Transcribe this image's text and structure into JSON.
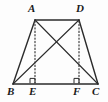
{
  "figure": {
    "width": 108,
    "height": 102,
    "background_color": "#fdfdfd",
    "stroke_color": "#2b2b2b",
    "label_color": "#1a1a1a"
  },
  "points": {
    "A": {
      "label": "A",
      "x": 35,
      "y": 20,
      "label_x": 28,
      "label_y": 3
    },
    "D": {
      "label": "D",
      "x": 79,
      "y": 20,
      "label_x": 76,
      "label_y": 3
    },
    "B": {
      "label": "B",
      "x": 13,
      "y": 84,
      "label_x": 7,
      "label_y": 86
    },
    "E": {
      "label": "E",
      "x": 35,
      "y": 84,
      "label_x": 29,
      "label_y": 86
    },
    "F": {
      "label": "F",
      "x": 79,
      "y": 84,
      "label_x": 73,
      "label_y": 86
    },
    "C": {
      "label": "C",
      "x": 98,
      "y": 84,
      "label_x": 92,
      "label_y": 86
    }
  },
  "segments": {
    "top_side_AD": {
      "name": "AD",
      "style": "solid",
      "from": "A",
      "to": "D"
    },
    "bottom_side_BC": {
      "name": "BC",
      "style": "solid",
      "from": "B",
      "to": "C"
    },
    "left_leg_AB": {
      "name": "AB",
      "style": "solid",
      "from": "A",
      "to": "B"
    },
    "right_leg_DC": {
      "name": "DC",
      "style": "solid",
      "from": "D",
      "to": "C"
    },
    "diagonal_AC": {
      "name": "AC",
      "style": "solid",
      "from": "A",
      "to": "C"
    },
    "diagonal_BD": {
      "name": "BD",
      "style": "solid",
      "from": "B",
      "to": "D"
    },
    "altitude_AE": {
      "name": "AE",
      "style": "dotted",
      "from": "A",
      "to": "E"
    },
    "altitude_DF": {
      "name": "DF",
      "style": "dotted",
      "from": "D",
      "to": "F"
    }
  },
  "right_angle_marks": [
    {
      "name": "right-angle-at-E",
      "vertex": "E",
      "x": 35,
      "y": 84,
      "size": 5
    },
    {
      "name": "right-angle-at-F",
      "vertex": "F",
      "x": 79,
      "y": 84,
      "size": 5
    }
  ]
}
